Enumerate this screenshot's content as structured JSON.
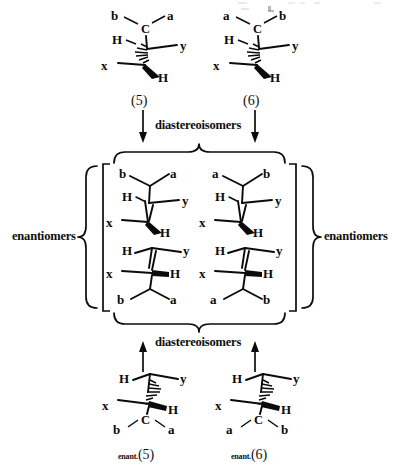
{
  "figure": {
    "type": "stereochemistry-relationship-diagram",
    "background": "#ffffff",
    "ink_color": "#0b0b0b"
  },
  "relations": {
    "diastereoisomers_top": "diastereoisomers",
    "diastereoisomers_bottom": "diastereoisomers",
    "enantiomers_left": "enantiomers",
    "enantiomers_right": "enantiomers"
  },
  "captions": {
    "top_left": "(5)",
    "top_right": "(6)",
    "bottom_left_prefix": "enant.",
    "bottom_left": "(5)",
    "bottom_right_prefix": "enant.",
    "bottom_right": "(6)"
  },
  "structures": {
    "top_left": {
      "name": "structure-5",
      "caption": "(5)",
      "upper_left": "b",
      "upper_right": "a",
      "center_atom": "C",
      "left": "H",
      "right": "y",
      "lower_left": "x",
      "lower_right": "H",
      "upper_bond_style": "hashed",
      "lower_bond_style": "wedge"
    },
    "top_right": {
      "name": "structure-6",
      "caption": "(6)",
      "upper_left": "a",
      "upper_right": "b",
      "center_atom": "C",
      "left": "H",
      "right": "y",
      "lower_left": "x",
      "lower_right": "H",
      "upper_bond_style": "hashed",
      "lower_bond_style": "wedge"
    },
    "box_top_left": {
      "name": "boxed-structure-upper-left",
      "upper_left": "b",
      "upper_right": "a",
      "left": "H",
      "right": "y",
      "lower_left": "x",
      "lower_right": "H",
      "lower_bond_style": "wedge"
    },
    "box_top_right": {
      "name": "boxed-structure-upper-right",
      "upper_left": "a",
      "upper_right": "b",
      "left": "H",
      "right": "y",
      "lower_left": "x",
      "lower_right": "H",
      "lower_bond_style": "wedge"
    },
    "box_bottom_left": {
      "name": "boxed-structure-lower-left",
      "upper_left": "H",
      "upper_right": "y",
      "left": "x",
      "right": "H",
      "lower_left": "b",
      "lower_right": "a",
      "right_bond_style": "wedge"
    },
    "box_bottom_right": {
      "name": "boxed-structure-lower-right",
      "upper_left": "H",
      "upper_right": "y",
      "left": "x",
      "right": "H",
      "lower_left": "a",
      "lower_right": "b",
      "right_bond_style": "wedge"
    },
    "bottom_left": {
      "name": "structure-enant-5",
      "caption": "enant.(5)",
      "upper_left": "H",
      "upper_right": "y",
      "left": "x",
      "right": "H",
      "center_atom": "C",
      "lower_left": "b",
      "lower_right": "a",
      "upper_bond_style": "hashed",
      "right_bond_style": "wedge"
    },
    "bottom_right": {
      "name": "structure-enant-6",
      "caption": "enant.(6)",
      "upper_left": "H",
      "upper_right": "y",
      "left": "x",
      "right": "H",
      "center_atom": "C",
      "lower_left": "a",
      "lower_right": "b",
      "upper_bond_style": "hashed",
      "right_bond_style": "wedge"
    }
  }
}
